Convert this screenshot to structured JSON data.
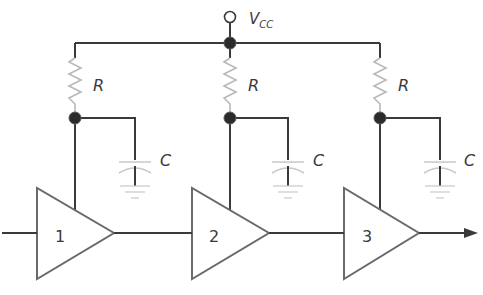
{
  "diagram": {
    "supply": {
      "label": "V",
      "subscript": "CC"
    },
    "stages": [
      {
        "amp_label": "1",
        "resistor_label": "R",
        "capacitor_label": "C"
      },
      {
        "amp_label": "2",
        "resistor_label": "R",
        "capacitor_label": "C"
      },
      {
        "amp_label": "3",
        "resistor_label": "R",
        "capacitor_label": "C"
      }
    ],
    "colors": {
      "wire": "#3a3a3a",
      "node": "#2b2b2b",
      "resistor": "#b8b8b8",
      "capacitor": "#c8c8c8",
      "amplifier_outline": "#6a6a6a"
    }
  }
}
